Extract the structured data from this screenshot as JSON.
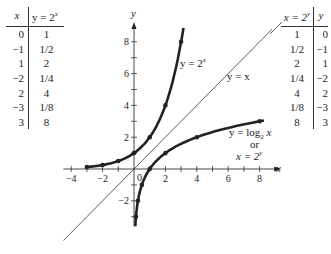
{
  "left_table": {
    "header_x": "x",
    "header_y": "y = 2",
    "header_y_exp": "x",
    "rows": [
      {
        "x": "0",
        "y": "1"
      },
      {
        "x": "−1",
        "y": "1/2"
      },
      {
        "x": "1",
        "y": "2"
      },
      {
        "x": "−2",
        "y": "1/4"
      },
      {
        "x": "2",
        "y": "4"
      },
      {
        "x": "−3",
        "y": "1/8"
      },
      {
        "x": "3",
        "y": "8"
      }
    ]
  },
  "right_table": {
    "header_x": "x = 2",
    "header_x_exp": "y",
    "header_y": "y",
    "rows": [
      {
        "x": "1",
        "y": "0"
      },
      {
        "x": "1/2",
        "y": "−1"
      },
      {
        "x": "2",
        "y": "1"
      },
      {
        "x": "1/4",
        "y": "−2"
      },
      {
        "x": "4",
        "y": "2"
      },
      {
        "x": "1/8",
        "y": "−3"
      },
      {
        "x": "8",
        "y": "3"
      }
    ]
  },
  "labels": {
    "exp_curve": "y = 2",
    "exp_curve_sup": "x",
    "identity_line": "y = x",
    "log_curve_line1": "y = log",
    "log_curve_sub": "2",
    "log_curve_var": " x",
    "log_curve_line2": "or",
    "log_curve_line3": "x = 2",
    "log_curve_line3_sup": "y",
    "axis_x": "x",
    "axis_y": "y",
    "origin": "0"
  },
  "chart_data": {
    "type": "line",
    "title": "",
    "xlabel": "x",
    "ylabel": "y",
    "xlim": [
      -4.5,
      8.8
    ],
    "ylim": [
      -4,
      9
    ],
    "x_ticks": [
      -4,
      -2,
      2,
      4,
      6,
      8
    ],
    "y_ticks": [
      -2,
      2,
      4,
      6,
      8
    ],
    "series": [
      {
        "name": "y = 2^x",
        "points": [
          [
            -3,
            0.125
          ],
          [
            -2,
            0.25
          ],
          [
            -1,
            0.5
          ],
          [
            0,
            1
          ],
          [
            1,
            2
          ],
          [
            2,
            4
          ],
          [
            3,
            8
          ]
        ]
      },
      {
        "name": "y = log2 x",
        "points": [
          [
            0.125,
            -3
          ],
          [
            0.25,
            -2
          ],
          [
            0.5,
            -1
          ],
          [
            1,
            0
          ],
          [
            2,
            1
          ],
          [
            4,
            2
          ],
          [
            8,
            3
          ]
        ]
      },
      {
        "name": "y = x",
        "points": [
          [
            -4.5,
            -4.5
          ],
          [
            8.8,
            8.8
          ]
        ]
      }
    ]
  }
}
